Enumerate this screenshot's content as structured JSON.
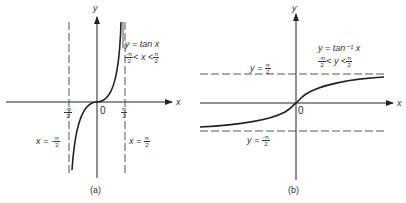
{
  "figures": [
    {
      "id": "a",
      "caption": "(a)",
      "function_label": "y = tan x",
      "domain_label": {
        "left": "-π/2",
        "lt1": "<",
        "var": "x",
        "lt2": "<",
        "right": "π/2"
      },
      "axis_x": "x",
      "axis_y": "y",
      "origin": "0",
      "tick_left": {
        "num": "-π",
        "den": "2"
      },
      "tick_right": {
        "num": "π",
        "den": "2"
      },
      "asymptote_left": {
        "prefix": "x = -",
        "num": "π",
        "den": "2"
      },
      "asymptote_right": {
        "prefix": "x = ",
        "num": "π",
        "den": "2"
      }
    },
    {
      "id": "b",
      "caption": "(b)",
      "function_label": "y = tan⁻¹ x",
      "domain_label": {
        "left": "-π/2",
        "lt1": "<",
        "var": "y",
        "lt2": "<",
        "right": "π/2"
      },
      "axis_x": "x",
      "axis_y": "y",
      "origin": "0",
      "asymptote_top": {
        "prefix": "y = ",
        "num": "π",
        "den": "2"
      },
      "asymptote_bottom": {
        "prefix": "y = ",
        "num": "-π",
        "den": "2"
      }
    }
  ]
}
